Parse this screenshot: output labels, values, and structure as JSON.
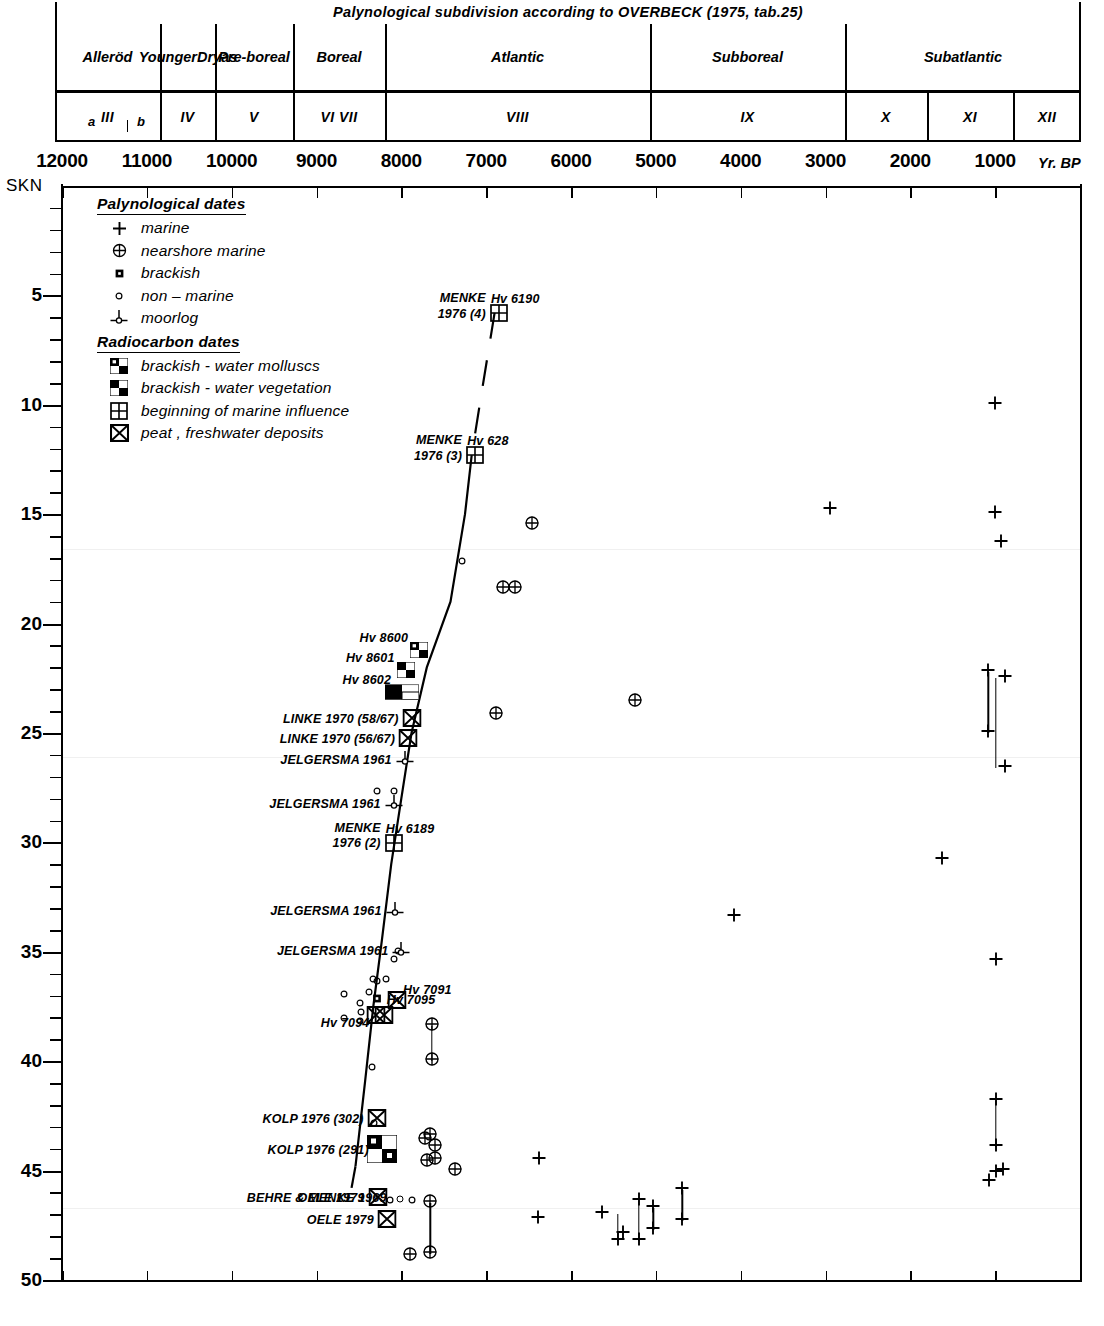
{
  "header": {
    "title": "Palynological  subdivision  according  to  OVERBECK (1975, tab.25)",
    "zones": [
      {
        "label": "Alleröd",
        "x0": 0,
        "x1": 105
      },
      {
        "label": "Younger\nDryas",
        "x0": 105,
        "x1": 160
      },
      {
        "label": "Pre-\nboreal",
        "x0": 160,
        "x1": 238
      },
      {
        "label": "Boreal",
        "x0": 238,
        "x1": 330
      },
      {
        "label": "Atlantic",
        "x0": 330,
        "x1": 595
      },
      {
        "label": "Subboreal",
        "x0": 595,
        "x1": 790
      },
      {
        "label": "Subatlantic",
        "x0": 790,
        "x1": 1026
      }
    ],
    "numbers": [
      {
        "label": "III",
        "x0": 0,
        "x1": 105
      },
      {
        "label": "IV",
        "x0": 105,
        "x1": 160
      },
      {
        "label": "V",
        "x0": 160,
        "x1": 238
      },
      {
        "label": "VI   VII",
        "x0": 238,
        "x1": 330
      },
      {
        "label": "VIII",
        "x0": 330,
        "x1": 595
      },
      {
        "label": "IX",
        "x0": 595,
        "x1": 790
      },
      {
        "label": "X",
        "x0": 790,
        "x1": 872
      },
      {
        "label": "XI",
        "x0": 872,
        "x1": 958
      },
      {
        "label": "XII",
        "x0": 958,
        "x1": 1026
      }
    ],
    "sub_a": "a",
    "sub_b": "b"
  },
  "legend": {
    "section1": "Palynological  dates",
    "section2": "Radiocarbon dates",
    "items1": [
      {
        "sym": "plus-icon",
        "label": "marine"
      },
      {
        "sym": "circle-plus-icon",
        "label": "nearshore marine"
      },
      {
        "sym": "small-filled-square-icon",
        "label": "brackish"
      },
      {
        "sym": "small-circle-icon",
        "label": "non – marine"
      },
      {
        "sym": "moorlog-icon",
        "label": "moorlog"
      }
    ],
    "items2": [
      {
        "sym": "checker-tl-br-icon",
        "label": "brackish - water molluscs"
      },
      {
        "sym": "checker-tr-bl-icon",
        "label": "brackish - water vegetation"
      },
      {
        "sym": "grid-square-icon",
        "label": "beginning of marine influence"
      },
      {
        "sym": "crossed-square-icon",
        "label": "peat , freshwater deposits"
      }
    ]
  },
  "chart_data": {
    "type": "scatter",
    "xlabel": "Yr. BP",
    "ylabel": "SKN",
    "yunit_note": "depth below SKN (m)",
    "xlim": [
      12000,
      0
    ],
    "ylim": [
      0,
      50
    ],
    "xticks": [
      12000,
      11000,
      10000,
      9000,
      8000,
      7000,
      6000,
      5000,
      4000,
      3000,
      2000,
      1000
    ],
    "xticklabels": [
      "12000",
      "11000",
      "10000",
      "9000",
      "8000",
      "7000",
      "6000",
      "5000",
      "4000",
      "3000",
      "2000",
      "1000"
    ],
    "yticks": [
      5,
      10,
      15,
      20,
      25,
      30,
      35,
      40,
      45,
      50
    ],
    "yticklabels": [
      "5",
      "10",
      "15",
      "20",
      "25",
      "30",
      "35",
      "40",
      "45",
      "50"
    ],
    "minor_ytick_step": 1,
    "grid": false,
    "axis_origin_label": "SKN",
    "curve": {
      "name": "sea-level curve",
      "points": [
        {
          "x": 6900,
          "y": 5.8
        },
        {
          "x": 7060,
          "y": 9.6
        },
        {
          "x": 7170,
          "y": 12.3
        },
        {
          "x": 7250,
          "y": 15.0
        },
        {
          "x": 7420,
          "y": 19.0
        },
        {
          "x": 7700,
          "y": 22.0
        },
        {
          "x": 7880,
          "y": 25.0
        },
        {
          "x": 8000,
          "y": 28.0
        },
        {
          "x": 8120,
          "y": 31.0
        },
        {
          "x": 8230,
          "y": 34.5
        },
        {
          "x": 8330,
          "y": 37.5
        },
        {
          "x": 8430,
          "y": 41.0
        },
        {
          "x": 8540,
          "y": 44.8
        },
        {
          "x": 8620,
          "y": 46.5
        }
      ]
    },
    "labelled_points": [
      {
        "label": "MENKE\n1976 (4)",
        "code": "Hv 6190",
        "sym": "grid-square-icon",
        "x": 6850,
        "y": 5.9
      },
      {
        "label": "MENKE\n1976 (3)",
        "code": "Hv 628",
        "sym": "grid-square-icon",
        "x": 7130,
        "y": 12.4
      },
      {
        "label": "",
        "code": "Hv 8600",
        "sym": "checker-tl-br-icon",
        "x": 7790,
        "y": 21.3
      },
      {
        "label": "",
        "code": "Hv 8601",
        "sym": "checker-tr-bl-icon",
        "x": 7950,
        "y": 22.2
      },
      {
        "label": "",
        "code": "Hv 8602",
        "sym": "checker-wide-icon",
        "x": 7990,
        "y": 23.2
      },
      {
        "label": "LINKE 1970 (58/67)",
        "code": "",
        "sym": "crossed-square-icon",
        "x": 7880,
        "y": 24.4
      },
      {
        "label": "LINKE 1970 (56/67)",
        "code": "",
        "sym": "crossed-square-icon",
        "x": 7920,
        "y": 25.3
      },
      {
        "label": "JELGERSMA 1961",
        "code": "",
        "sym": "moorlog-icon",
        "x": 7960,
        "y": 26.3
      },
      {
        "label": "JELGERSMA 1961",
        "code": "",
        "sym": "moorlog-icon",
        "x": 8090,
        "y": 28.3
      },
      {
        "label": "MENKE\n1976 (2)",
        "code": "Hv 6189",
        "sym": "grid-square-icon",
        "x": 8090,
        "y": 30.1
      },
      {
        "label": "JELGERSMA 1961",
        "code": "",
        "sym": "moorlog-icon",
        "x": 8080,
        "y": 33.2
      },
      {
        "label": "JELGERSMA 1961",
        "code": "",
        "sym": "moorlog-icon",
        "x": 8000,
        "y": 35.0
      },
      {
        "label": "",
        "code": "Hv 7091",
        "sym": "crossed-square-icon",
        "x": 8050,
        "y": 37.3
      },
      {
        "label": "",
        "code": "Hv 7095",
        "sym": "small-filled-square-icon",
        "x": 8290,
        "y": 37.1
      },
      {
        "label": "",
        "code": "Hv 7094",
        "sym": "crossed-square-icon",
        "x": 8210,
        "y": 38.0
      },
      {
        "label": "",
        "code": "",
        "sym": "crossed-square-icon",
        "x": 8300,
        "y": 38.0
      },
      {
        "label": "KOLP 1976 (302)",
        "code": "",
        "sym": "crossed-square-icon",
        "x": 8290,
        "y": 42.7
      },
      {
        "label": "KOLP 1976 (291)",
        "code": "",
        "sym": "checker-big-icon",
        "x": 8230,
        "y": 44.1
      },
      {
        "label": "OELE 1979",
        "code": "",
        "sym": "crossed-square-icon",
        "x": 8280,
        "y": 46.3
      },
      {
        "label": "OELE 1979",
        "code": "",
        "sym": "crossed-square-icon",
        "x": 8170,
        "y": 47.3
      },
      {
        "label": "BEHRE & MENKE 1969",
        "code": "",
        "sym": "moorlog-span-icon",
        "x": 8020,
        "y": 46.3
      }
    ],
    "series": [
      {
        "name": "marine",
        "sym": "plus-icon",
        "points": [
          {
            "x": 2950,
            "y": 14.8
          },
          {
            "x": 1000,
            "y": 10.0
          },
          {
            "x": 1000,
            "y": 15.0
          },
          {
            "x": 930,
            "y": 16.3
          },
          {
            "x": 1630,
            "y": 30.8
          },
          {
            "x": 990,
            "y": 35.4
          },
          {
            "x": 990,
            "y": 41.8
          },
          {
            "x": 990,
            "y": 43.9
          },
          {
            "x": 990,
            "y": 45.1
          },
          {
            "x": 910,
            "y": 45.0
          },
          {
            "x": 1070,
            "y": 45.5
          },
          {
            "x": 880,
            "y": 22.5
          },
          {
            "x": 880,
            "y": 26.6
          },
          {
            "x": 1080,
            "y": 22.2
          },
          {
            "x": 1080,
            "y": 25.0
          },
          {
            "x": 4080,
            "y": 33.4
          },
          {
            "x": 6380,
            "y": 44.5
          },
          {
            "x": 5640,
            "y": 47.0
          },
          {
            "x": 5450,
            "y": 48.2
          },
          {
            "x": 5390,
            "y": 47.9
          },
          {
            "x": 5200,
            "y": 48.2
          },
          {
            "x": 5200,
            "y": 46.4
          },
          {
            "x": 5030,
            "y": 46.7
          },
          {
            "x": 5030,
            "y": 47.7
          },
          {
            "x": 4690,
            "y": 45.9
          },
          {
            "x": 4690,
            "y": 47.3
          },
          {
            "x": 6390,
            "y": 47.2
          }
        ]
      },
      {
        "name": "nearshore marine",
        "sym": "circle-plus-icon",
        "points": [
          {
            "x": 6460,
            "y": 15.5
          },
          {
            "x": 6800,
            "y": 18.4
          },
          {
            "x": 6660,
            "y": 18.4
          },
          {
            "x": 6880,
            "y": 24.2
          },
          {
            "x": 5250,
            "y": 23.6
          },
          {
            "x": 7640,
            "y": 38.4
          },
          {
            "x": 7640,
            "y": 40.0
          },
          {
            "x": 7660,
            "y": 43.4
          },
          {
            "x": 7600,
            "y": 43.9
          },
          {
            "x": 7720,
            "y": 43.6
          },
          {
            "x": 7600,
            "y": 44.5
          },
          {
            "x": 7700,
            "y": 44.6
          },
          {
            "x": 7370,
            "y": 45.0
          },
          {
            "x": 7660,
            "y": 46.5
          },
          {
            "x": 7660,
            "y": 48.8
          },
          {
            "x": 7900,
            "y": 48.9
          }
        ]
      },
      {
        "name": "non - marine",
        "sym": "small-circle-icon",
        "points": [
          {
            "x": 7290,
            "y": 17.1
          },
          {
            "x": 8090,
            "y": 27.6
          },
          {
            "x": 8290,
            "y": 27.6
          },
          {
            "x": 8040,
            "y": 34.9
          },
          {
            "x": 8090,
            "y": 35.3
          },
          {
            "x": 8180,
            "y": 36.2
          },
          {
            "x": 8290,
            "y": 36.3
          },
          {
            "x": 8330,
            "y": 36.2
          },
          {
            "x": 8380,
            "y": 36.8
          },
          {
            "x": 8490,
            "y": 37.3
          },
          {
            "x": 8480,
            "y": 37.7
          },
          {
            "x": 8490,
            "y": 38.1
          },
          {
            "x": 8680,
            "y": 36.9
          },
          {
            "x": 8680,
            "y": 38.0
          },
          {
            "x": 8350,
            "y": 40.2
          },
          {
            "x": 8320,
            "y": 42.8
          }
        ]
      },
      {
        "name": "brackish",
        "sym": "small-filled-square-icon",
        "points": []
      }
    ],
    "error_bars": [
      {
        "x": 990,
        "y_top": 22.5,
        "y_bot": 26.6
      },
      {
        "x": 1080,
        "y_top": 22.2,
        "y_bot": 25.0
      },
      {
        "x": 990,
        "y_top": 41.8,
        "y_bot": 43.9
      },
      {
        "x": 7640,
        "y_top": 38.4,
        "y_bot": 40.0
      },
      {
        "x": 5450,
        "y_top": 47.0,
        "y_bot": 48.2
      },
      {
        "x": 5200,
        "y_top": 46.4,
        "y_bot": 48.2
      },
      {
        "x": 5030,
        "y_top": 46.7,
        "y_bot": 47.7
      },
      {
        "x": 4690,
        "y_top": 45.9,
        "y_bot": 47.3
      },
      {
        "x": 7660,
        "y_top": 46.5,
        "y_bot": 48.8
      }
    ],
    "moorlog_spans": [
      {
        "x0": 7870,
        "x1": 8130,
        "y": 46.3
      }
    ]
  }
}
